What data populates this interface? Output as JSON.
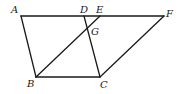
{
  "diagram": {
    "title": "",
    "points": {
      "A": {
        "label": "A"
      },
      "D": {
        "label": "D"
      },
      "E": {
        "label": "E"
      },
      "F": {
        "label": "F"
      },
      "G": {
        "label": "G"
      },
      "B": {
        "label": "B"
      },
      "C": {
        "label": "C"
      }
    },
    "segments": [
      [
        "A",
        "F"
      ],
      [
        "A",
        "B"
      ],
      [
        "B",
        "C"
      ],
      [
        "D",
        "C"
      ],
      [
        "B",
        "E"
      ],
      [
        "C",
        "F"
      ]
    ]
  }
}
